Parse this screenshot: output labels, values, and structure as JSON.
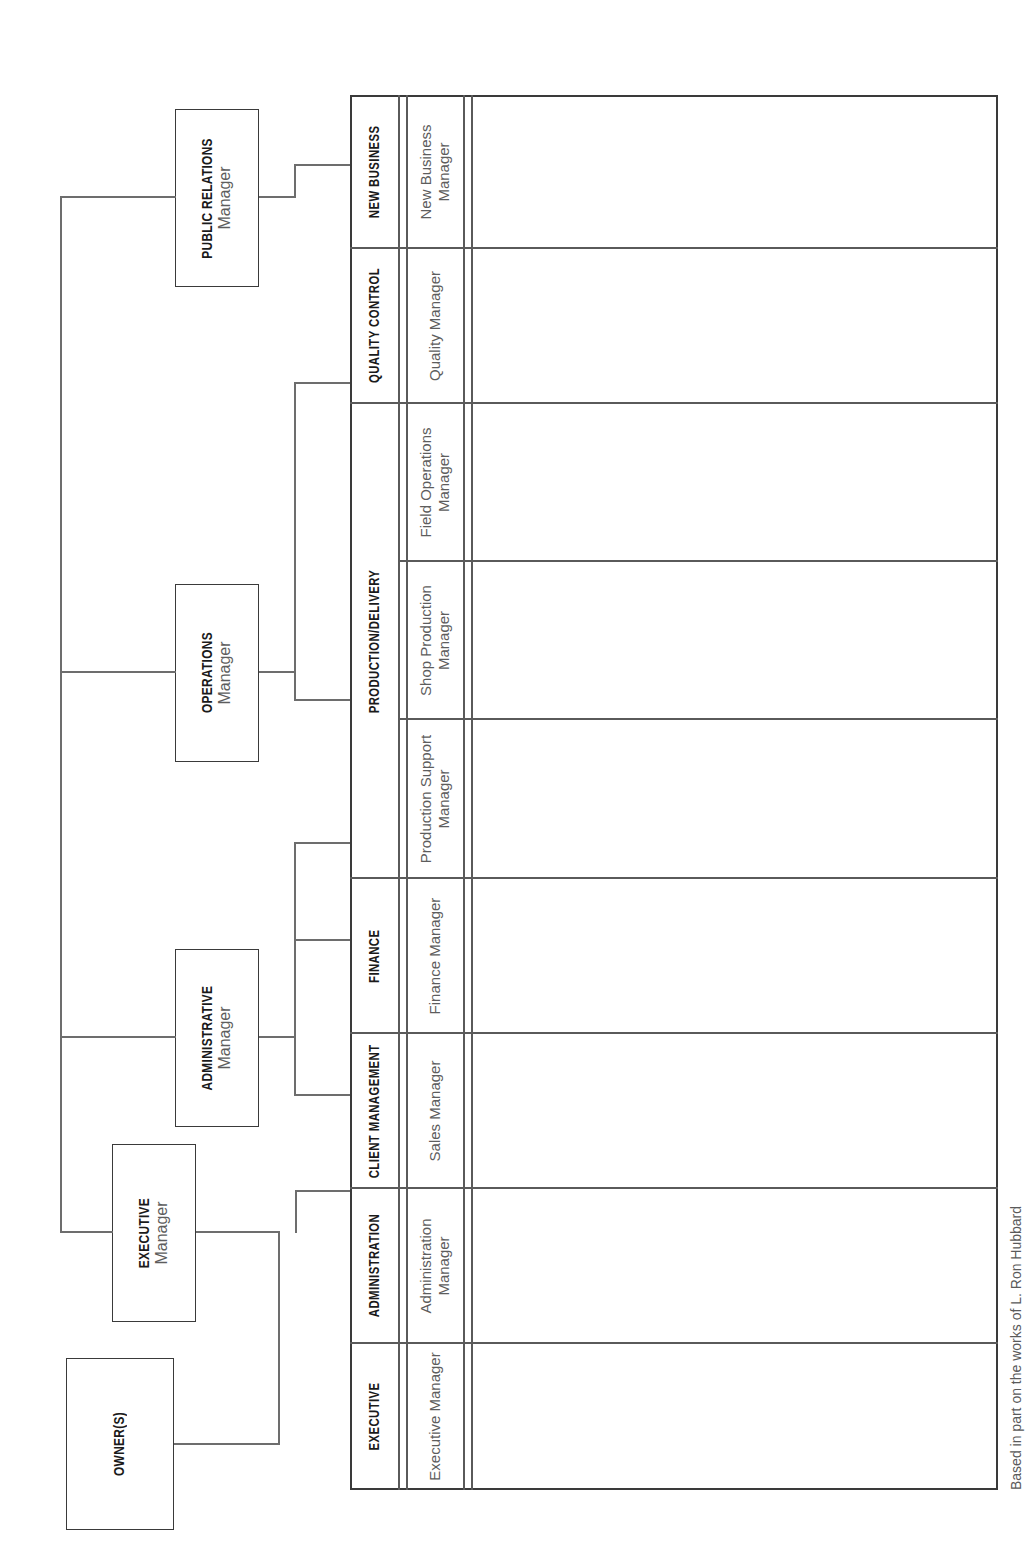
{
  "chart_title": "Organizational Chart",
  "credit": "Based in part on the works of L. Ron Hubbard",
  "top_nodes": {
    "owners": {
      "title": "OWNER(S)",
      "subtitle": ""
    },
    "executive": {
      "title": "EXECUTIVE",
      "subtitle": "Manager"
    },
    "administrative": {
      "title": "ADMINISTRATIVE",
      "subtitle": "Manager"
    },
    "operations": {
      "title": "OPERATIONS",
      "subtitle": "Manager"
    },
    "public_relations": {
      "title": "PUBLIC RELATIONS",
      "subtitle": "Manager"
    }
  },
  "matrix": {
    "divisions": [
      {
        "name": "EXECUTIVE",
        "managers": [
          "Executive Manager"
        ]
      },
      {
        "name": "ADMINISTRATION",
        "managers": [
          "Administration Manager"
        ]
      },
      {
        "name": "CLIENT MANAGEMENT",
        "managers": [
          "Sales Manager"
        ]
      },
      {
        "name": "FINANCE",
        "managers": [
          "Finance Manager"
        ]
      },
      {
        "name": "PRODUCTION/DELIVERY",
        "managers": [
          "Production Support Manager",
          "Shop Production Manager",
          "Field Operations Manager"
        ]
      },
      {
        "name": "QUALITY CONTROL",
        "managers": [
          "Quality Manager"
        ]
      },
      {
        "name": "NEW BUSINESS",
        "managers": [
          "New Business Manager"
        ]
      }
    ]
  },
  "colors": {
    "line": "#6d6d6d",
    "border": "#3a3a3a",
    "heading_text": "#1a1a1a",
    "body_text": "#5d5d5d",
    "background": "#ffffff"
  }
}
